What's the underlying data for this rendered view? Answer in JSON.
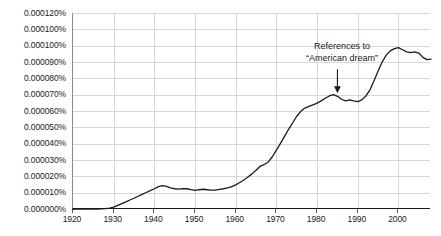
{
  "chart_data": {
    "type": "line",
    "title": "",
    "xlabel": "",
    "ylabel": "",
    "xlim": [
      1920,
      2008
    ],
    "ylim": [
      0.0,
      0.00012
    ],
    "grid": true,
    "legend_position": "none",
    "line_color": "#1a1a1a",
    "x_tick_labels": [
      "1920",
      "1930",
      "1940",
      "1950",
      "1960",
      "1970",
      "1980",
      "1990",
      "2000"
    ],
    "x_ticks": [
      1920,
      1930,
      1940,
      1950,
      1960,
      1970,
      1980,
      1990,
      2000
    ],
    "y_tick_labels": [
      "0.000120%",
      "0.000100%",
      "0.000100%",
      "0.000090%",
      "0.000080%",
      "0.000070%",
      "0.000060%",
      "0.000050%",
      "0.000040%",
      "0.000030%",
      "0.000020%",
      "0.000010%",
      "0.000000%"
    ],
    "y_ticks": [
      0.00012,
      0.00011,
      0.0001,
      9e-05,
      8e-05,
      7e-05,
      6e-05,
      5e-05,
      4e-05,
      3e-05,
      2e-05,
      1e-05,
      0.0
    ],
    "series": [
      {
        "name": "American dream",
        "x": [
          1920,
          1922,
          1924,
          1926,
          1928,
          1929,
          1930,
          1931,
          1932,
          1933,
          1934,
          1935,
          1936,
          1937,
          1938,
          1939,
          1940,
          1941,
          1942,
          1943,
          1944,
          1945,
          1946,
          1947,
          1948,
          1949,
          1950,
          1951,
          1952,
          1953,
          1954,
          1955,
          1956,
          1957,
          1958,
          1959,
          1960,
          1961,
          1962,
          1963,
          1964,
          1965,
          1966,
          1967,
          1968,
          1969,
          1970,
          1971,
          1972,
          1973,
          1974,
          1975,
          1976,
          1977,
          1978,
          1979,
          1980,
          1981,
          1982,
          1983,
          1984,
          1985,
          1986,
          1987,
          1988,
          1989,
          1990,
          1991,
          1992,
          1993,
          1994,
          1995,
          1996,
          1997,
          1998,
          1999,
          2000,
          2001,
          2002,
          2003,
          2004,
          2005,
          2006,
          2007,
          2008
        ],
        "y": [
          0.0,
          0.0,
          0.0,
          0.0,
          2e-07,
          5e-07,
          1.2e-06,
          2.2e-06,
          3.3e-06,
          4.4e-06,
          5.5e-06,
          6.6e-06,
          7.8e-06,
          9e-06,
          1.01e-05,
          1.12e-05,
          1.24e-05,
          1.37e-05,
          1.43e-05,
          1.38e-05,
          1.3e-05,
          1.24e-05,
          1.22e-05,
          1.25e-05,
          1.24e-05,
          1.18e-05,
          1.14e-05,
          1.18e-05,
          1.21e-05,
          1.18e-05,
          1.15e-05,
          1.16e-05,
          1.2e-05,
          1.24e-05,
          1.29e-05,
          1.37e-05,
          1.48e-05,
          1.62e-05,
          1.78e-05,
          1.96e-05,
          2.15e-05,
          2.37e-05,
          2.62e-05,
          2.72e-05,
          2.88e-05,
          3.2e-05,
          3.6e-05,
          4.02e-05,
          4.45e-05,
          4.88e-05,
          5.28e-05,
          5.68e-05,
          5.98e-05,
          6.18e-05,
          6.28e-05,
          6.38e-05,
          6.48e-05,
          6.62e-05,
          6.78e-05,
          6.92e-05,
          7e-05,
          6.9e-05,
          6.72e-05,
          6.62e-05,
          6.68e-05,
          6.62e-05,
          6.58e-05,
          6.68e-05,
          6.92e-05,
          7.3e-05,
          7.85e-05,
          8.45e-05,
          9e-05,
          9.42e-05,
          9.68e-05,
          9.82e-05,
          9.88e-05,
          9.75e-05,
          9.62e-05,
          9.58e-05,
          9.62e-05,
          9.55e-05,
          9.28e-05,
          9.15e-05,
          9.18e-05
        ]
      }
    ],
    "annotations": [
      {
        "name": "american-dream-callout",
        "line1": "References to",
        "line2": "“American dream”",
        "arrow": "down-arrow",
        "points_to_year": 1985
      }
    ]
  }
}
